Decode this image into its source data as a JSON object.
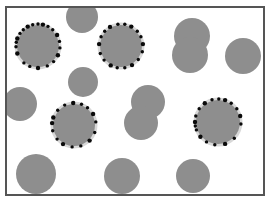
{
  "figure": {
    "width": 269,
    "height": 199,
    "background": "#ffffff",
    "frame": {
      "x": 6,
      "y": 7,
      "width": 258,
      "height": 188,
      "stroke": "#555555",
      "stroke_width": 2
    },
    "colors": {
      "particle_fill": "#8e8e8e",
      "halo_fill": "#d8d8d8",
      "dot_fill": "#0a0a0a"
    },
    "plain_particles": [
      {
        "id": "p1",
        "cx": 82,
        "cy": 17,
        "r": 16
      },
      {
        "id": "p2",
        "cx": 83,
        "cy": 82,
        "r": 15
      },
      {
        "id": "p3",
        "cx": 20,
        "cy": 104,
        "r": 17
      },
      {
        "id": "p4",
        "cx": 192,
        "cy": 36,
        "r": 18
      },
      {
        "id": "p5",
        "cx": 190,
        "cy": 55,
        "r": 18
      },
      {
        "id": "p6",
        "cx": 243,
        "cy": 56,
        "r": 18
      },
      {
        "id": "p7",
        "cx": 148,
        "cy": 102,
        "r": 17
      },
      {
        "id": "p8",
        "cx": 141,
        "cy": 123,
        "r": 17
      },
      {
        "id": "p9",
        "cx": 36,
        "cy": 174,
        "r": 20
      },
      {
        "id": "p10",
        "cx": 122,
        "cy": 176,
        "r": 18
      },
      {
        "id": "p11",
        "cx": 193,
        "cy": 176,
        "r": 17
      }
    ],
    "decorated_particles": [
      {
        "id": "d1",
        "cx": 38,
        "cy": 46,
        "r": 21,
        "dot_angles": [
          200,
          215,
          228,
          242,
          256,
          270,
          283,
          297,
          312,
          330,
          348,
          5,
          25,
          45,
          65,
          90,
          112,
          130,
          160,
          178,
          190
        ],
        "dot_gaps": []
      },
      {
        "id": "d2",
        "cx": 121,
        "cy": 46,
        "r": 21,
        "dot_angles": [
          185,
          205,
          222,
          240,
          262,
          280,
          298,
          318,
          335,
          355,
          15,
          38,
          60,
          80,
          100,
          118,
          140,
          160
        ],
        "dot_gaps": []
      },
      {
        "id": "d3",
        "cx": 74,
        "cy": 125,
        "r": 21,
        "dot_angles": [
          200,
          222,
          245,
          268,
          290,
          308,
          330,
          352,
          20,
          45,
          72,
          95,
          120,
          140,
          165,
          185
        ],
        "dot_gaps": []
      },
      {
        "id": "d4",
        "cx": 218,
        "cy": 122,
        "r": 22,
        "dot_angles": [
          180,
          195,
          215,
          235,
          255,
          272,
          288,
          305,
          325,
          345,
          5,
          45,
          72,
          98,
          120,
          140,
          160,
          170
        ],
        "dot_gaps": []
      }
    ]
  }
}
